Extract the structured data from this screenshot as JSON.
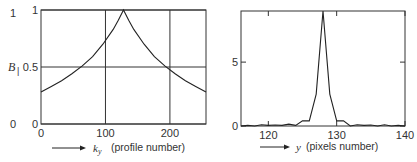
{
  "chart_data": [
    {
      "type": "line",
      "title": "",
      "outer_ylabel": "B|",
      "outer_yticks": [
        "1",
        "0.5",
        "0"
      ],
      "xlabel_symbol": "k_y",
      "xlabel": "(profile number)",
      "xticks": [
        0,
        100,
        200
      ],
      "yticks": [
        0,
        0.5,
        1
      ],
      "ytick_labels": [
        "0",
        "0.5",
        "1"
      ],
      "xlim": [
        0,
        256
      ],
      "ylim": [
        0,
        1
      ],
      "grid": true,
      "x": [
        0,
        16,
        32,
        48,
        64,
        80,
        96,
        112,
        120,
        128,
        136,
        144,
        160,
        176,
        192,
        208,
        224,
        240,
        256
      ],
      "values": [
        0.28,
        0.33,
        0.38,
        0.44,
        0.51,
        0.59,
        0.7,
        0.83,
        0.91,
        1.0,
        0.91,
        0.83,
        0.7,
        0.59,
        0.51,
        0.44,
        0.38,
        0.33,
        0.28
      ]
    },
    {
      "type": "line",
      "title": "",
      "xlabel_symbol": "y",
      "xlabel": "(pixels number)",
      "xticks": [
        120,
        130,
        140
      ],
      "yticks": [
        0,
        5
      ],
      "ytick_labels": [
        "0",
        "5"
      ],
      "xlim": [
        116,
        140
      ],
      "ylim": [
        0,
        9
      ],
      "grid": false,
      "x": [
        116,
        117,
        118,
        119,
        120,
        121,
        122,
        123,
        124,
        125,
        126,
        127,
        128,
        129,
        130,
        131,
        132,
        133,
        134,
        135,
        136,
        137,
        138,
        139,
        140
      ],
      "values": [
        0.0,
        0.05,
        0.0,
        0.1,
        0.05,
        0.08,
        0.05,
        0.15,
        0.05,
        0.4,
        0.4,
        2.5,
        9.0,
        2.5,
        0.4,
        0.4,
        0.0,
        0.1,
        0.05,
        0.08,
        0.0,
        0.1,
        0.0,
        0.05,
        0.0
      ]
    }
  ]
}
